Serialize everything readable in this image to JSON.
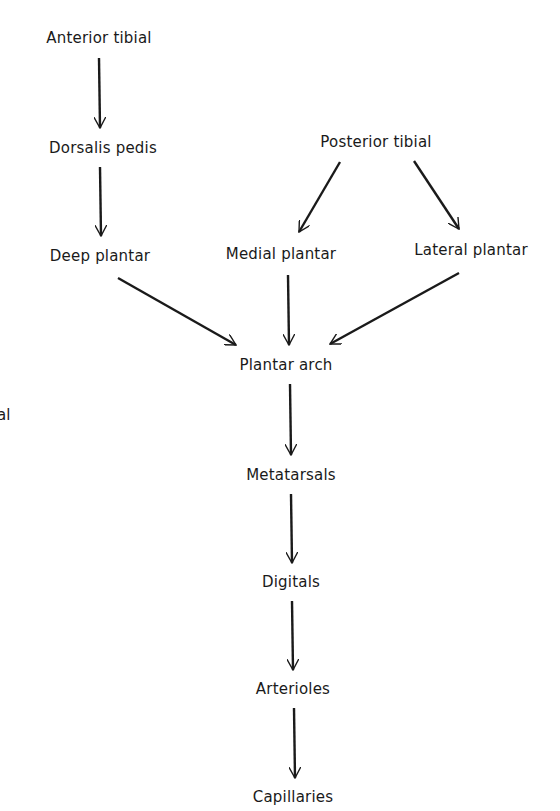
{
  "diagram": {
    "type": "flowchart",
    "direction": "top-to-bottom",
    "nodes": [
      {
        "id": "anterior_tibial",
        "label": "Anterior tibial",
        "x": 99,
        "y": 38
      },
      {
        "id": "dorsalis_pedis",
        "label": "Dorsalis pedis",
        "x": 103,
        "y": 148
      },
      {
        "id": "posterior_tibial",
        "label": "Posterior tibial",
        "x": 376,
        "y": 142
      },
      {
        "id": "deep_plantar",
        "label": "Deep plantar",
        "x": 100,
        "y": 256
      },
      {
        "id": "medial_plantar",
        "label": "Medial plantar",
        "x": 281,
        "y": 254
      },
      {
        "id": "lateral_plantar",
        "label": "Lateral plantar",
        "x": 471,
        "y": 250
      },
      {
        "id": "plantar_arch",
        "label": "Plantar arch",
        "x": 286,
        "y": 365
      },
      {
        "id": "metatarsals",
        "label": "Metatarsals",
        "x": 291,
        "y": 475
      },
      {
        "id": "digitals",
        "label": "Digitals",
        "x": 291,
        "y": 582
      },
      {
        "id": "arterioles",
        "label": "Arterioles",
        "x": 293,
        "y": 689
      },
      {
        "id": "capillaries",
        "label": "Capillaries",
        "x": 293,
        "y": 797
      }
    ],
    "edges": [
      {
        "from": "anterior_tibial",
        "to": "dorsalis_pedis"
      },
      {
        "from": "dorsalis_pedis",
        "to": "deep_plantar"
      },
      {
        "from": "posterior_tibial",
        "to": "medial_plantar"
      },
      {
        "from": "posterior_tibial",
        "to": "lateral_plantar"
      },
      {
        "from": "deep_plantar",
        "to": "plantar_arch"
      },
      {
        "from": "medial_plantar",
        "to": "plantar_arch"
      },
      {
        "from": "lateral_plantar",
        "to": "plantar_arch"
      },
      {
        "from": "plantar_arch",
        "to": "metatarsals"
      },
      {
        "from": "metatarsals",
        "to": "digitals"
      },
      {
        "from": "digitals",
        "to": "arterioles"
      },
      {
        "from": "arterioles",
        "to": "capillaries"
      }
    ],
    "edge_fragment_text": "al"
  }
}
